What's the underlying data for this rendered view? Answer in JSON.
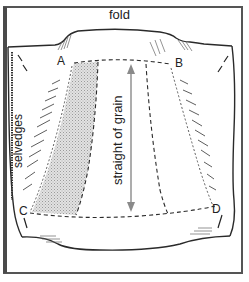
{
  "diagram": {
    "type": "sewing-illustration",
    "labels": {
      "fold": "fold",
      "selvedges": "selvedges",
      "grain": "straight of grain",
      "points": [
        "A",
        "B",
        "C",
        "D"
      ]
    },
    "colors": {
      "line": "#2a2a2a",
      "frame": "#555555",
      "shading": "#d6d6d6",
      "arrow": "#8a8a8a",
      "background": "#ffffff"
    }
  }
}
